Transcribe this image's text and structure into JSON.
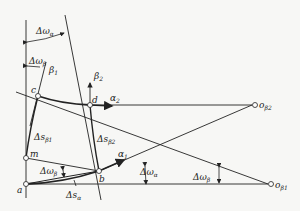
{
  "diagram": {
    "type": "velocity-triangle / relative-coordinate geometric construction",
    "points": [
      {
        "id": "a",
        "label": "a"
      },
      {
        "id": "m",
        "label": "m"
      },
      {
        "id": "c",
        "label": "c"
      },
      {
        "id": "d",
        "label": "d"
      },
      {
        "id": "b",
        "label": "b"
      },
      {
        "id": "o_beta2",
        "label": "o",
        "sub": "β2"
      },
      {
        "id": "o_beta1",
        "label": "o",
        "sub": "β1"
      }
    ],
    "labels": {
      "delta_omega_alpha_top": {
        "main": "Δω",
        "sub": "α"
      },
      "delta_omega_beta_left": {
        "main": "Δω",
        "sub": "β"
      },
      "beta1": {
        "main": "β",
        "sub": "1"
      },
      "beta2": {
        "main": "β",
        "sub": "2"
      },
      "alpha2": {
        "main": "α",
        "sub": "2"
      },
      "alpha1": {
        "main": "α",
        "sub": "1"
      },
      "delta_s_beta1": {
        "main": "Δs",
        "sub": "β1"
      },
      "delta_s_beta2": {
        "main": "Δs",
        "sub": "β2"
      },
      "delta_omega_beta_low": {
        "main": "Δω",
        "sub": "β"
      },
      "delta_s_alpha": {
        "main": "Δs",
        "sub": "α"
      },
      "delta_omega_alpha_mid": {
        "main": "Δω",
        "sub": "α"
      },
      "delta_omega_beta_right": {
        "main": "Δω",
        "sub": "β"
      }
    }
  }
}
